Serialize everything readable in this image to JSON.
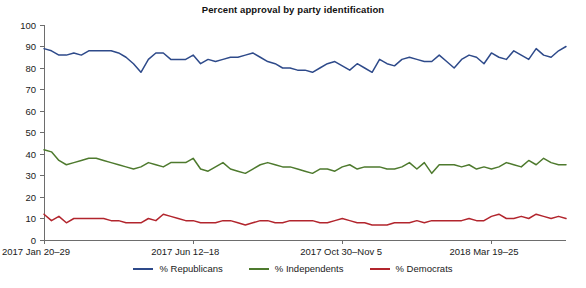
{
  "chart_data": {
    "type": "line",
    "title": "Percent approval by party identification",
    "xlabel": "",
    "ylabel": "",
    "ylim": [
      0,
      100
    ],
    "ytick_step": 10,
    "yticks": [
      0,
      10,
      20,
      30,
      40,
      50,
      60,
      70,
      80,
      90,
      100
    ],
    "grid": false,
    "legend_position": "bottom-center",
    "xtick_labels": [
      "2017 Jan 20–29",
      "2017 Jun 12–18",
      "2017 Oct 30–Nov 5",
      "2018 Mar 19–25"
    ],
    "xtick_indices": [
      0,
      20,
      40,
      60
    ],
    "x_index_count": 71,
    "series": [
      {
        "name": "% Republicans",
        "color": "#2e4a8a",
        "values": [
          89,
          88,
          86,
          86,
          87,
          86,
          88,
          88,
          88,
          88,
          87,
          85,
          82,
          78,
          84,
          87,
          87,
          84,
          84,
          84,
          86,
          82,
          84,
          83,
          84,
          85,
          85,
          86,
          87,
          85,
          83,
          82,
          80,
          80,
          79,
          79,
          78,
          80,
          82,
          83,
          81,
          79,
          82,
          80,
          78,
          84,
          82,
          81,
          84,
          85,
          84,
          83,
          83,
          86,
          83,
          80,
          84,
          86,
          85,
          82,
          87,
          85,
          84,
          88,
          86,
          84,
          89,
          86,
          85,
          88,
          90
        ]
      },
      {
        "name": "% Independents",
        "color": "#4e7a2e",
        "values": [
          42,
          41,
          37,
          35,
          36,
          37,
          38,
          38,
          37,
          36,
          35,
          34,
          33,
          34,
          36,
          35,
          34,
          36,
          36,
          36,
          38,
          33,
          32,
          34,
          36,
          33,
          32,
          31,
          33,
          35,
          36,
          35,
          34,
          34,
          33,
          32,
          31,
          33,
          33,
          32,
          34,
          35,
          33,
          34,
          34,
          34,
          33,
          33,
          34,
          36,
          33,
          36,
          31,
          35,
          35,
          35,
          34,
          35,
          33,
          34,
          33,
          34,
          36,
          35,
          34,
          37,
          35,
          38,
          36,
          35,
          35
        ]
      },
      {
        "name": "% Democrats",
        "color": "#b2252d",
        "values": [
          12,
          9,
          11,
          8,
          10,
          10,
          10,
          10,
          10,
          9,
          9,
          8,
          8,
          8,
          10,
          9,
          12,
          11,
          10,
          9,
          9,
          8,
          8,
          8,
          9,
          9,
          8,
          7,
          8,
          9,
          9,
          8,
          8,
          9,
          9,
          9,
          9,
          8,
          8,
          9,
          10,
          9,
          8,
          8,
          7,
          7,
          7,
          8,
          8,
          8,
          9,
          8,
          9,
          9,
          9,
          9,
          9,
          10,
          9,
          9,
          11,
          12,
          10,
          10,
          11,
          10,
          12,
          11,
          10,
          11,
          10
        ]
      }
    ]
  },
  "legend": [
    {
      "label": "% Republicans",
      "color": "#2e4a8a"
    },
    {
      "label": "% Independents",
      "color": "#4e7a2e"
    },
    {
      "label": "% Democrats",
      "color": "#b2252d"
    }
  ]
}
